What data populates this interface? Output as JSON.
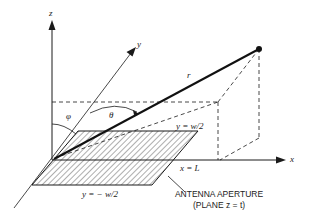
{
  "diagram": {
    "axes": {
      "x_label": "x",
      "y_label": "y",
      "z_label": "z"
    },
    "vector_label": "r",
    "angles": {
      "theta": "θ",
      "phi": "φ"
    },
    "edge_labels": {
      "top_edge": "y = w/2",
      "bottom_edge": "y = − w/2",
      "right_edge": "x = L"
    },
    "caption": {
      "line1": "ANTENNA APERTURE",
      "line2": "(PLANE z = t)"
    },
    "colors": {
      "ink": "#1a1a1a",
      "background": "#ffffff"
    }
  }
}
